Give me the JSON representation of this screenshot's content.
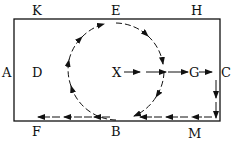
{
  "diagram": {
    "labels": {
      "K": "K",
      "E": "E",
      "H": "H",
      "A": "A",
      "D": "D",
      "X": "X",
      "G": "G",
      "C": "C",
      "F": "F",
      "B": "B",
      "M": "M"
    },
    "colors": {
      "stroke": "#111111",
      "background": "#ffffff"
    },
    "paths": [
      {
        "name": "X to G",
        "from": "X",
        "to": "G"
      },
      {
        "name": "G to C",
        "from": "G",
        "to": "C"
      },
      {
        "name": "C to M",
        "from": "C",
        "to": "M"
      },
      {
        "name": "M to B",
        "from": "M",
        "to": "B"
      },
      {
        "name": "B to F",
        "from": "B",
        "to": "F"
      },
      {
        "name": "circle loop",
        "through": [
          "B",
          "E"
        ],
        "direction": "clockwise"
      }
    ]
  }
}
